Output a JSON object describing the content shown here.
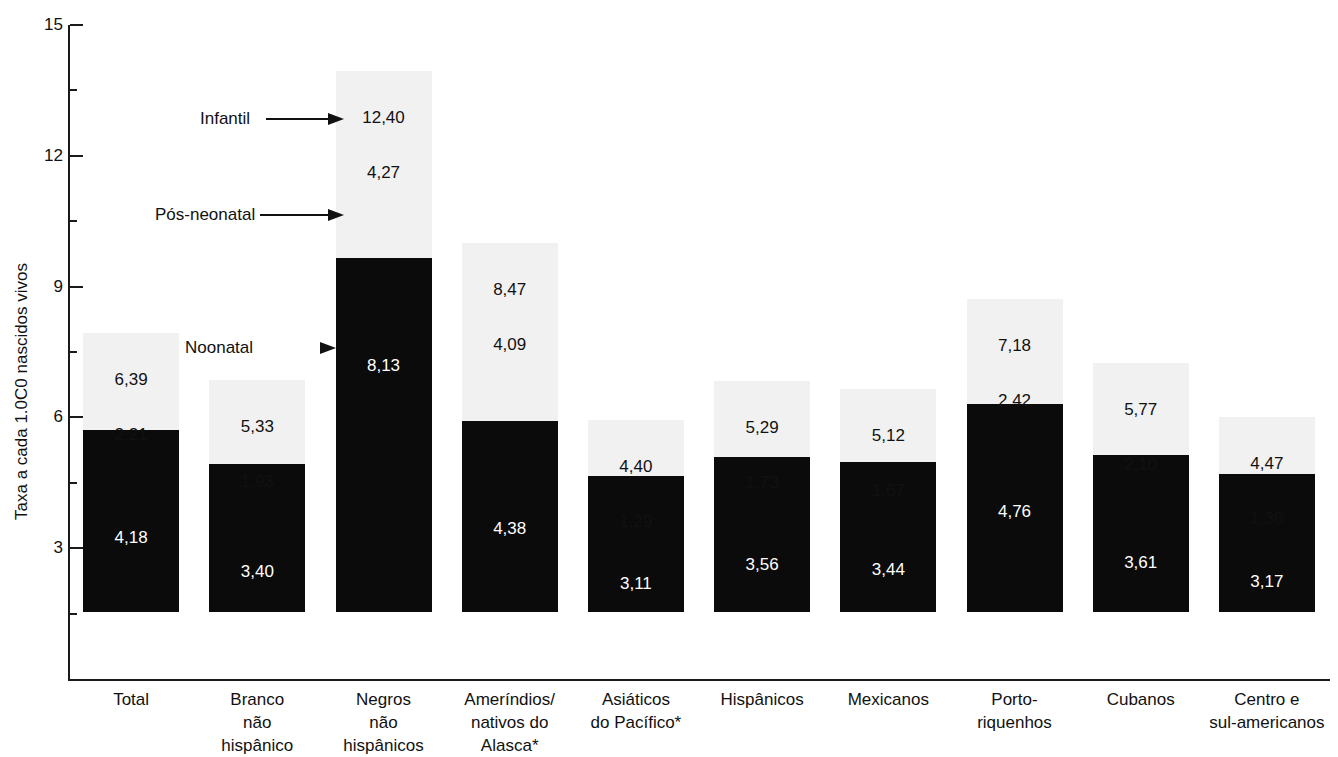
{
  "chart_data": {
    "type": "bar",
    "subtype": "stacked-bar",
    "title": "",
    "xlabel": "",
    "ylabel": "Taxa a cada 1.0C0 nascidos vivos",
    "ylim": [
      0,
      15
    ],
    "y_major_ticks": [
      3,
      6,
      9,
      12,
      15
    ],
    "y_minor_ticks": [
      1.5,
      4.5,
      7.5,
      10.5,
      13.5
    ],
    "y_tick_labels": [
      "3",
      "6",
      "9",
      "12",
      "15"
    ],
    "grid": false,
    "legend_position": "inline-annotations",
    "decimal_separator": ",",
    "categories": [
      "Total",
      "Branco não hispânico",
      "Negros não hispânicos",
      "Ameríndios/ nativos do Alasca*",
      "Asiáticos do Pacífico*",
      "Hispânicos",
      "Mexicanos",
      "Porto- riquenhos",
      "Cubanos",
      "Centro e sul-americanos"
    ],
    "series": [
      {
        "name": "Neonatal",
        "color": "#0b0b0b",
        "values": [
          4.18,
          3.4,
          8.13,
          4.38,
          3.11,
          3.56,
          3.44,
          4.76,
          3.61,
          3.17
        ],
        "labels": [
          "4,18",
          "3,40",
          "8,13",
          "4,38",
          "3,11",
          "3,56",
          "3,44",
          "4,76",
          "3,61",
          "3,17"
        ]
      },
      {
        "name": "Pós-neonatal",
        "color": "#f1f1f1",
        "values": [
          2.21,
          1.93,
          4.27,
          4.09,
          1.29,
          1.73,
          1.67,
          2.42,
          2.1,
          1.3
        ],
        "labels": [
          "2,21",
          "1,93",
          "4,27",
          "4,09",
          "1,29",
          "1,73",
          "1,67",
          "2,42",
          "2,10",
          "1,30"
        ]
      }
    ],
    "totals": {
      "name": "Infantil",
      "values": [
        6.39,
        5.33,
        12.4,
        8.47,
        4.4,
        5.29,
        5.12,
        7.18,
        5.77,
        4.47
      ],
      "labels": [
        "6,39",
        "5,33",
        "12,40",
        "8,47",
        "4,40",
        "5,29",
        "5,12",
        "7,18",
        "5,77",
        "4,47"
      ]
    }
  },
  "axis": {
    "y_title": "Taxa a cada 1.0C0 nascidos vivos",
    "ticks": [
      {
        "label": "15"
      },
      {
        "label": "12"
      },
      {
        "label": "9"
      },
      {
        "label": "6"
      },
      {
        "label": "3"
      }
    ]
  },
  "annotations": [
    {
      "id": "infantil",
      "label": "Infantil",
      "arrow": "long"
    },
    {
      "id": "pos-neonatal",
      "label": "Pós-neonatal",
      "arrow": "long"
    },
    {
      "id": "neonatal",
      "label": "Noonatal",
      "arrow": "head-only"
    }
  ],
  "bars": [
    {
      "category_lines": [
        "Total"
      ],
      "total_label": "6,39",
      "post_label": "2,21",
      "neo_label": "4,18"
    },
    {
      "category_lines": [
        "Branco",
        "não",
        "hispânico"
      ],
      "total_label": "5,33",
      "post_label": "1,93",
      "neo_label": "3,40"
    },
    {
      "category_lines": [
        "Negros",
        "não",
        "hispânicos"
      ],
      "total_label": "12,40",
      "post_label": "4,27",
      "neo_label": "8,13"
    },
    {
      "category_lines": [
        "Ameríndios/",
        "nativos do",
        "Alasca*"
      ],
      "total_label": "8,47",
      "post_label": "4,09",
      "neo_label": "4,38"
    },
    {
      "category_lines": [
        "Asiáticos",
        "do Pacífico*"
      ],
      "total_label": "4,40",
      "post_label": "1,29",
      "neo_label": "3,11"
    },
    {
      "category_lines": [
        "Hispânicos"
      ],
      "total_label": "5,29",
      "post_label": "1,73",
      "neo_label": "3,56"
    },
    {
      "category_lines": [
        "Mexicanos"
      ],
      "total_label": "5,12",
      "post_label": "1,67",
      "neo_label": "3,44"
    },
    {
      "category_lines": [
        "Porto-",
        "riquenhos"
      ],
      "total_label": "7,18",
      "post_label": "2,42",
      "neo_label": "4,76"
    },
    {
      "category_lines": [
        "Cubanos"
      ],
      "total_label": "5,77",
      "post_label": "2,10",
      "neo_label": "3,61"
    },
    {
      "category_lines": [
        "Centro e",
        "sul-americanos"
      ],
      "total_label": "4,47",
      "post_label": "1,30",
      "neo_label": "3,17"
    }
  ],
  "colors": {
    "neonatal": "#0b0b0b",
    "postneonatal": "#f1f1f1",
    "axis": "#1a1a1a",
    "text": "#111111",
    "value_on_dark": "#ffffff",
    "background": "#ffffff"
  }
}
